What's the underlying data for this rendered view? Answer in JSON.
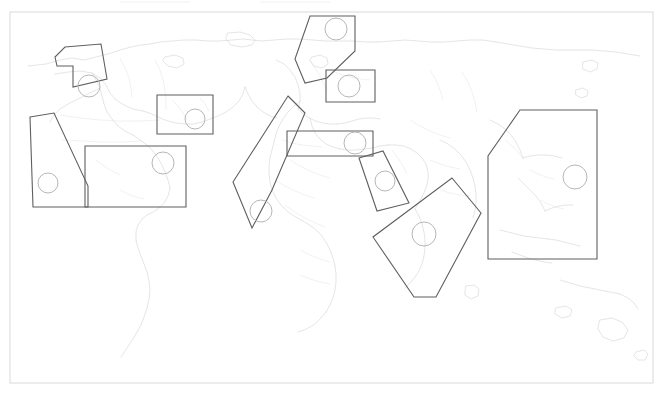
{
  "figure": {
    "name": "world-map-region-annotations",
    "background_color": "#ffffff",
    "frame": {
      "x": 10,
      "y": 12,
      "width": 643,
      "height": 371,
      "stroke": "#d9d9d9"
    },
    "map_style": {
      "coastline_color": "#cfcfcf",
      "border_color": "#dcdcdc",
      "region_outline_color": "#5f5f5f",
      "marker_circle_color": "#b7b7b7"
    }
  },
  "regions": [
    {
      "name": "alaska-northwest-canada",
      "shape": "polygon",
      "points": "65,47 101,44 107,79 73,87 73,66 57,66 55,57",
      "marker": {
        "cx": 89,
        "cy": 86,
        "r": 11
      }
    },
    {
      "name": "western-north-america",
      "shape": "polygon",
      "points": "30,117 54,113 88,186 88,207 33,207",
      "marker": {
        "cx": 48,
        "cy": 183,
        "r": 10
      }
    },
    {
      "name": "caribbean-central-america",
      "shape": "rect",
      "points": "85,146 186,146 186,207 85,207",
      "marker": {
        "cx": 163,
        "cy": 163,
        "r": 11
      }
    },
    {
      "name": "japan-korea",
      "shape": "rect",
      "points": "157,95 213,95 213,134 157,134",
      "marker": {
        "cx": 195,
        "cy": 119,
        "r": 10
      }
    },
    {
      "name": "scandinavia-northern-europe",
      "shape": "polygon",
      "points": "310,16 355,16 355,51 327,78 305,83 295,59",
      "marker": {
        "cx": 336,
        "cy": 29,
        "r": 11
      }
    },
    {
      "name": "central-europe",
      "shape": "rect",
      "points": "326,70 375,70 375,102 326,102",
      "marker": {
        "cx": 349,
        "cy": 86,
        "r": 11
      }
    },
    {
      "name": "europe-west-africa-corridor",
      "shape": "polygon",
      "points": "288,96 305,113 272,190 252,228 233,182",
      "marker": {
        "cx": 261,
        "cy": 211,
        "r": 11
      }
    },
    {
      "name": "mediterranean-middle-east-band",
      "shape": "rect",
      "points": "287,131 373,131 373,156 287,156",
      "marker": {
        "cx": 355,
        "cy": 143,
        "r": 11
      }
    },
    {
      "name": "arabian-peninsula",
      "shape": "polygon",
      "points": "359,158 383,151 409,203 377,211",
      "marker": {
        "cx": 385,
        "cy": 181,
        "r": 10
      }
    },
    {
      "name": "indian-ocean-east-africa",
      "shape": "polygon",
      "points": "452,178 481,213 436,297 414,297 373,237",
      "marker": {
        "cx": 424,
        "cy": 234,
        "r": 12
      }
    },
    {
      "name": "southeast-asia-pacific",
      "shape": "polygon",
      "points": "520,110 597,110 597,259 488,259 488,156",
      "marker": {
        "cx": 575,
        "cy": 177,
        "r": 12
      }
    }
  ],
  "map_geometry": {
    "coastlines": [
      "M 28,66 L 46,64 L 60,60 L 72,58 L 84,60 L 96,57 L 108,54 L 120,50 L 131,47 L 141,45 L 150,44",
      "M 150,44 L 160,42 L 172,41 L 184,40 L 196,40 L 208,41 L 220,41 L 232,40 L 243,39 L 252,40 L 262,41",
      "M 262,41 L 274,40 L 287,39 L 300,39 L 313,40 L 326,41 L 340,41 L 353,41 L 366,42 L 378,42",
      "M 378,42 L 392,41 L 405,40 L 418,41 L 431,42 L 444,42 L 457,41 L 470,40 L 483,40 L 496,42",
      "M 496,42 L 508,44 L 520,46 L 532,48 L 544,49 L 556,50 L 568,50 L 580,50 L 592,50 L 604,51 L 616,52 L 628,54 L 640,56",
      "M 55,74 L 68,72 L 80,71 L 92,73 L 100,78 L 106,85 L 110,93 L 116,100 L 124,105 L 133,109 L 143,111",
      "M 143,111 L 152,114 L 160,118 L 168,121 L 176,123 L 185,124 L 194,124 L 202,122 L 210,119",
      "M 92,73 L 96,80 L 100,88 L 102,96 L 104,104 L 107,112 L 112,119 L 118,126 L 125,131 L 133,135",
      "M 133,135 L 140,140 L 147,145 L 153,151 L 158,158 L 162,165 L 165,172 L 168,180 L 170,188",
      "M 170,188 L 168,196 L 164,203 L 159,208 L 153,212 L 147,215 L 142,219 L 138,225 L 136,232 L 136,240",
      "M 136,240 L 138,248 L 141,256 L 144,264 L 147,272 L 149,281 L 150,290 L 149,299 L 147,308",
      "M 147,308 L 144,317 L 141,325 L 137,332 L 133,339 L 129,345 L 125,351 L 121,357",
      "M 100,88 L 92,92 L 84,96 L 76,100 L 68,104 L 60,109 L 54,115 L 50,122",
      "M 210,119 L 218,116 L 226,112 L 233,107 L 239,101 L 243,94 L 245,87",
      "M 245,87 L 248,94 L 252,101 L 257,107 L 263,112 L 270,116 L 277,118",
      "M 276,60 L 284,64 L 290,70 L 295,77 L 298,85 L 300,93 L 300,101 L 298,109",
      "M 298,109 L 303,114 L 309,118 L 316,121 L 323,123 L 330,124 L 337,124",
      "M 337,124 L 345,123 L 352,121 L 359,119 L 366,118 L 373,118 L 380,119",
      "M 310,118 L 312,126 L 315,133 L 320,139 L 326,144 L 333,147 L 340,149",
      "M 340,149 L 348,150 L 356,150 L 364,149 L 372,148 L 380,146 L 388,145",
      "M 388,145 L 396,145 L 404,146 L 411,149 L 417,153 L 422,158 L 426,164",
      "M 426,164 L 428,172 L 428,180 L 426,188 L 423,195 L 419,202 L 415,209",
      "M 300,101 L 294,106 L 288,112 L 283,119 L 279,126 L 276,134 L 274,142",
      "M 274,142 L 272,150 L 270,158 L 269,166 L 269,174 L 270,182 L 272,190",
      "M 272,190 L 276,198 L 281,205 L 287,211 L 294,216 L 301,220 L 308,224",
      "M 308,224 L 315,229 L 321,235 L 326,242 L 330,250 L 333,258 L 335,266",
      "M 335,266 L 336,274 L 336,282 L 335,290 L 333,298 L 330,305 L 326,312",
      "M 326,312 L 321,318 L 316,323 L 310,327 L 304,330 L 298,332",
      "M 415,209 L 419,216 L 422,224 L 424,232 L 425,240 L 425,248 L 424,256",
      "M 424,256 L 422,264 L 419,271 L 415,277 L 410,283 L 405,288",
      "M 440,140 L 448,144 L 455,149 L 461,155 L 466,162 L 470,170 L 473,178",
      "M 473,178 L 475,186 L 476,194 L 476,202 L 475,210 L 473,218",
      "M 490,120 L 498,124 L 505,129 L 511,135 L 516,142 L 520,150 L 523,158",
      "M 523,158 L 530,156 L 538,155 L 546,155 L 554,156 L 562,158",
      "M 518,178 L 524,184 L 530,190 L 536,196 L 541,203 L 545,211",
      "M 545,211 L 552,208 L 559,206 L 566,205 L 573,205",
      "M 500,230 L 508,232 L 516,234 L 524,236 L 532,237 L 540,238 L 548,239",
      "M 548,239 L 556,240 L 564,242 L 572,244 L 580,246",
      "M 512,252 L 520,255 L 528,258 L 536,260 L 544,262 L 552,263",
      "M 560,280 L 570,283 L 580,286 L 590,288 L 600,290 L 610,292 L 620,294",
      "M 620,294 L 628,298 L 634,303 L 638,309"
    ],
    "country_borders": [
      "M 155,60 L 160,70 L 163,80 L 165,90 L 166,100 L 166,110",
      "M 120,58 L 125,68 L 129,78 L 131,88 L 132,98",
      "M 60,115 L 80,118 L 100,120 L 120,121 L 140,121 L 160,120",
      "M 62,140 L 82,141 L 102,142 L 122,142 L 142,141",
      "M 310,60 L 315,68 L 320,76 L 324,84 L 327,92",
      "M 330,70 L 340,74 L 350,77 L 360,79 L 370,80",
      "M 282,140 L 292,143 L 302,145 L 312,146 L 322,147",
      "M 290,160 L 300,166 L 310,171 L 320,175 L 330,178",
      "M 275,180 L 285,186 L 295,191 L 305,195 L 315,198",
      "M 285,205 L 295,212 L 305,218 L 315,223 L 325,227",
      "M 300,250 L 310,255 L 320,259 L 330,262",
      "M 300,275 L 310,279 L 320,282 L 330,284",
      "M 392,150 L 398,158 L 403,166 L 407,174",
      "M 410,120 L 420,126 L 430,131 L 440,135 L 450,138",
      "M 430,160 L 440,164 L 450,167 L 460,169",
      "M 440,190 L 450,193 L 460,195 L 470,196",
      "M 462,72 L 468,82 L 472,92 L 475,102 L 477,112",
      "M 430,70 L 436,80 L 440,90 L 443,100",
      "M 505,140 L 512,146 L 518,152 L 523,159",
      "M 530,170 L 538,174 L 546,177 L 554,179",
      "M 540,200 L 548,204 L 556,207 L 564,209",
      "M 96,160 L 104,166 L 112,171 L 120,175",
      "M 120,190 L 128,194 L 136,197 L 144,199",
      "M 172,100 L 178,106 L 183,113 L 187,120",
      "M 200,98 L 205,104 L 209,111"
    ],
    "islands": [
      "M 228,33 L 240,32 L 250,35 L 255,40 L 252,45 L 242,47 L 231,45 L 226,39 Z",
      "M 165,57 L 175,55 L 183,58 L 184,64 L 177,68 L 168,66 L 163,61 Z",
      "M 312,57 L 320,55 L 327,58 L 328,64 L 322,68 L 314,66 L 310,61 Z",
      "M 583,62 L 592,60 L 598,63 L 597,69 L 590,72 L 583,69 Z",
      "M 576,90 L 583,88 L 588,91 L 587,96 L 581,98 L 576,95 Z",
      "M 600,320 L 612,318 L 622,322 L 628,330 L 624,338 L 613,341 L 603,337 L 598,329 Z",
      "M 636,352 L 644,350 L 648,354 L 645,360 L 638,360 L 634,356 Z",
      "M 556,308 L 566,306 L 572,310 L 570,316 L 562,318 L 555,314 Z",
      "M 466,286 L 474,285 L 479,289 L 478,296 L 471,299 L 465,295 Z"
    ]
  }
}
